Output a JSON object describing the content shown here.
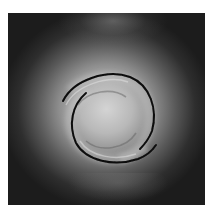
{
  "image": {
    "description": "Grayscale photograph of a two-armed spiral vortex with a bright diffuse center fading to a dark background",
    "colors": {
      "background": "#1c1c1c",
      "center_glow": "#d4d4d4",
      "mid_glow": "#8e8e8e",
      "arm_shadow": "#0a0a0a",
      "page_background": "#ffffff"
    }
  }
}
